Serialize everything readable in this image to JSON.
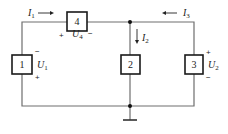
{
  "diagram": {
    "type": "circuit-schematic",
    "elements": [
      {
        "id": "1",
        "label": "1",
        "voltage": {
          "symbol": "U",
          "sub": "1",
          "plus": "+",
          "minus": "−"
        }
      },
      {
        "id": "2",
        "label": "2"
      },
      {
        "id": "3",
        "label": "3",
        "voltage": {
          "symbol": "U",
          "sub": "2",
          "plus": "+",
          "minus": "−"
        }
      },
      {
        "id": "4",
        "label": "4",
        "voltage": {
          "symbol": "U",
          "sub": "4",
          "plus": "+",
          "minus": "−"
        }
      }
    ],
    "currents": [
      {
        "symbol": "I",
        "sub": "1",
        "direction": "right"
      },
      {
        "symbol": "I",
        "sub": "2",
        "direction": "down"
      },
      {
        "symbol": "I",
        "sub": "3",
        "direction": "left"
      }
    ],
    "ground": "ground-symbol",
    "colors": {
      "wire": "#6e6e6e",
      "box": "#1a1a1a",
      "text": "#222222"
    }
  }
}
